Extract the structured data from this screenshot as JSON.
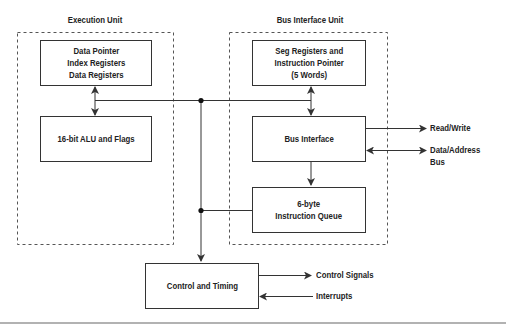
{
  "diagram": {
    "groups": [
      {
        "id": "execution-unit",
        "title": "Execution Unit"
      },
      {
        "id": "bus-interface-unit",
        "title": "Bus Interface Unit"
      }
    ],
    "blocks": {
      "registers": "Data Pointer\nIndex Registers\nData Registers",
      "alu": "16-bit ALU and Flags",
      "seg_registers": "Seg Registers and\nInstruction Pointer\n(5 Words)",
      "bus_interface": "Bus Interface",
      "instruction_queue": "6-byte\nInstruction Queue",
      "control_timing": "Control and Timing"
    },
    "signals": {
      "read_write": "Read/Write",
      "data_address_bus": "Data/Address Bus",
      "control_signals": "Control Signals",
      "interrupts": "Interrupts"
    },
    "colors": {
      "line": "#333333",
      "dashed": "#555555",
      "background": "#ffffff"
    }
  }
}
